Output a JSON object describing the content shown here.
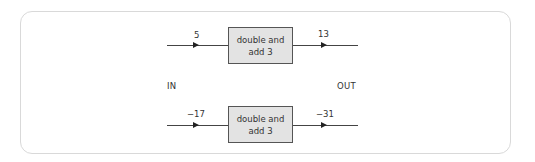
{
  "diagram": {
    "in_label": "IN",
    "out_label": "OUT",
    "machines": [
      {
        "rule": "double and add 3",
        "rule_line1": "double and",
        "rule_line2": "add 3",
        "input": "5",
        "output": "13"
      },
      {
        "rule": "double and add 3",
        "rule_line1": "double and",
        "rule_line2": "add 3",
        "input": "−17",
        "output": "−31"
      }
    ]
  },
  "colors": {
    "frame_border": "#d9d9d9",
    "box_fill": "#e3e3e3",
    "box_border": "#555555",
    "line": "#444444",
    "text": "#333333"
  }
}
